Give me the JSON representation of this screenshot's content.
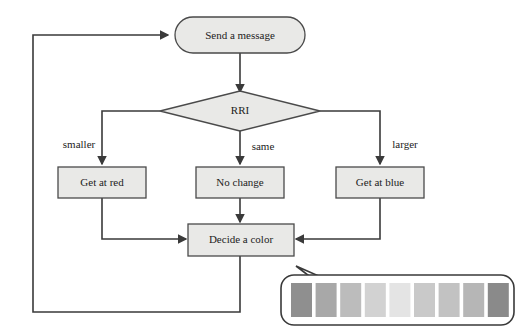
{
  "diagram": {
    "type": "flowchart",
    "nodes": {
      "start": {
        "label": "Send a message",
        "shape": "stadium"
      },
      "decision": {
        "label": "RRI",
        "shape": "diamond"
      },
      "left_action": {
        "label": "Get at red",
        "shape": "rectangle"
      },
      "middle_action": {
        "label": "No change",
        "shape": "rectangle"
      },
      "right_action": {
        "label": "Get at blue",
        "shape": "rectangle"
      },
      "merge": {
        "label": "Decide a color",
        "shape": "rectangle"
      }
    },
    "edge_labels": {
      "smaller": "smaller",
      "same": "same",
      "larger": "larger"
    },
    "callout": {
      "name": "color-swatch-callout",
      "swatches": [
        "#8f8f8f",
        "#a8a8a8",
        "#bcbcbc",
        "#d2d2d2",
        "#e4e4e4",
        "#c9c9c9",
        "#c2c2c2",
        "#b6b6b6",
        "#8a8a8a"
      ]
    },
    "colors": {
      "shape_fill": "#e9e9e7",
      "shape_stroke": "#4a4a4a",
      "connector": "#3a3a3a",
      "text": "#222222",
      "background": "#ffffff"
    }
  }
}
